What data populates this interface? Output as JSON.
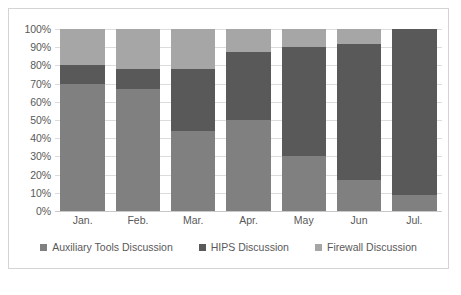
{
  "chart_data": {
    "type": "bar",
    "subtype": "stacked-percent",
    "title": "",
    "xlabel": "",
    "ylabel": "",
    "ylim": [
      0,
      100
    ],
    "grid": true,
    "legend_position": "bottom",
    "categories": [
      "Jan.",
      "Feb.",
      "Mar.",
      "Apr.",
      "May",
      "Jun",
      "Jul."
    ],
    "y_ticks": [
      "0%",
      "10%",
      "20%",
      "30%",
      "40%",
      "50%",
      "60%",
      "70%",
      "80%",
      "90%",
      "100%"
    ],
    "y_tick_values": [
      0,
      10,
      20,
      30,
      40,
      50,
      60,
      70,
      80,
      90,
      100
    ],
    "series": [
      {
        "name": "Auxiliary Tools Discussion",
        "color": "#808080",
        "values": [
          70,
          67,
          44,
          50,
          30,
          17,
          9
        ]
      },
      {
        "name": "HIPS Discussion",
        "color": "#595959",
        "values": [
          10,
          11,
          34,
          37.5,
          60,
          75,
          91
        ]
      },
      {
        "name": "Firewall Discussion",
        "color": "#a6a6a6",
        "values": [
          20,
          22,
          22,
          12.5,
          10,
          8,
          0
        ]
      }
    ]
  },
  "legend": {
    "items": [
      {
        "label": "Auxiliary Tools Discussion",
        "color": "#808080"
      },
      {
        "label": "HIPS Discussion",
        "color": "#595959"
      },
      {
        "label": "Firewall Discussion",
        "color": "#a6a6a6"
      }
    ]
  },
  "caption": {
    "text": ""
  }
}
